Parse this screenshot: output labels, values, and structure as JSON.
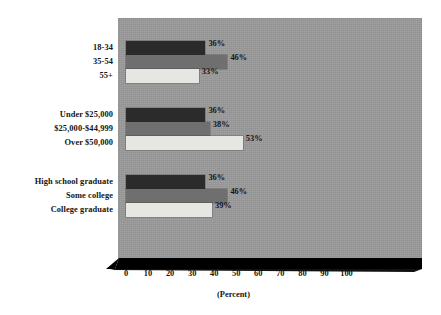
{
  "chart_data": {
    "type": "bar",
    "orientation": "horizontal",
    "title": "",
    "xlabel": "(Percent)",
    "ylabel": "",
    "xlim": [
      0,
      100
    ],
    "xticks": [
      "0",
      "10",
      "20",
      "30",
      "40",
      "50",
      "60",
      "70",
      "80",
      "90",
      "100"
    ],
    "grid": false,
    "legend": false,
    "value_suffix": "%",
    "groups": [
      {
        "name": "Age",
        "categories": [
          "18-34",
          "35-54",
          "55+"
        ],
        "values": [
          36,
          46,
          33
        ],
        "labels": [
          "36%",
          "46%",
          "33%"
        ]
      },
      {
        "name": "Household income",
        "categories": [
          "Under $25,000",
          "$25,000-$44,999",
          "Over $50,000"
        ],
        "values": [
          36,
          38,
          53
        ],
        "labels": [
          "36%",
          "38%",
          "53%"
        ]
      },
      {
        "name": "Education",
        "categories": [
          "High school graduate",
          "Some college",
          "College graduate"
        ],
        "values": [
          36,
          46,
          39
        ],
        "labels": [
          "36%",
          "46%",
          "39%"
        ]
      }
    ],
    "series_colors": [
      "#2b2b2b",
      "#6f6f6f",
      "#e6e6e3"
    ],
    "panel_color": "#9a9a9a",
    "baseline_color": "#000000"
  }
}
